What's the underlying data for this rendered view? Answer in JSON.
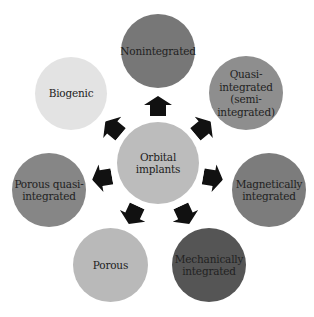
{
  "diagram": {
    "center": {
      "label": "Orbital\nimplants",
      "line1": "Orbital",
      "line2": "implants",
      "color": "#bcbcbc"
    },
    "nodes": [
      {
        "id": "nonintegrated",
        "lines": [
          "Nonintegrated"
        ],
        "color": "#777777"
      },
      {
        "id": "quasi-integrated",
        "lines": [
          "Quasi-",
          "integrated",
          "(semi-",
          "integrated)"
        ],
        "color": "#8e8e8e"
      },
      {
        "id": "magnetically-integrated",
        "lines": [
          "Magnetically",
          "integrated"
        ],
        "color": "#7c7c7c"
      },
      {
        "id": "mechanically-integrated",
        "lines": [
          "Mechanically",
          "integrated"
        ],
        "color": "#555555"
      },
      {
        "id": "porous",
        "lines": [
          "Porous"
        ],
        "color": "#b9b9b9"
      },
      {
        "id": "porous-quasi-integrated",
        "lines": [
          "Porous quasi-",
          "integrated"
        ],
        "color": "#868686"
      },
      {
        "id": "biogenic",
        "lines": [
          "Biogenic"
        ],
        "color": "#e3e3e3"
      }
    ],
    "arrow_color": "#111111"
  }
}
